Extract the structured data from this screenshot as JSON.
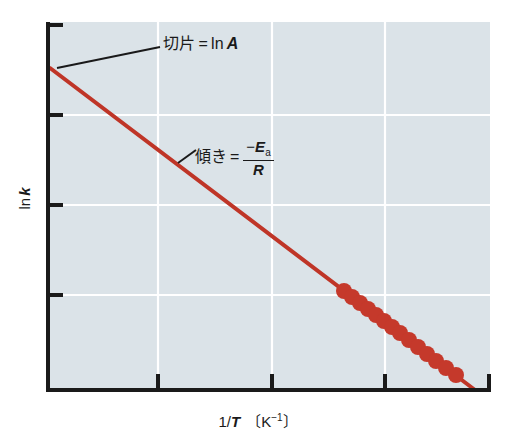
{
  "figure": {
    "background_color": "#ffffff",
    "plot_background_color": "#dbe3e8",
    "gridline_color": "#ffffff",
    "axis_color": "#1a1a1a",
    "series_color": "#bf3527"
  },
  "annotations": {
    "intercept": {
      "jp": "切片",
      "equals": "=",
      "ln": "ln",
      "variable": "A",
      "full_text": "切片 = ln A"
    },
    "slope": {
      "jp": "傾き",
      "equals": "=",
      "numerator_minus": "−",
      "numerator_symbol": "E",
      "numerator_subscript": "a",
      "denominator": "R",
      "full_text": "傾き = −Ea/R"
    }
  },
  "axes": {
    "x_title_main": "1/",
    "x_title_italic": "T",
    "x_title_unit_open": "〔K",
    "x_title_unit_exp": "−1",
    "x_title_unit_close": "〕",
    "x_title_full": "1/T 〔K⁻¹〕",
    "y_title_main": "ln",
    "y_title_italic": "k",
    "y_title_full": "ln k"
  },
  "chart_data": {
    "type": "line",
    "title": "",
    "subtitle": "",
    "xlabel": "1/T 〔K⁻¹〕",
    "ylabel": "ln k",
    "grid": true,
    "legend": "none",
    "x_tick_labels": [
      "",
      "",
      "",
      "",
      ""
    ],
    "y_tick_labels": [
      "",
      "",
      "",
      ""
    ],
    "x_tick_positions_px": [
      48,
      158,
      272,
      385,
      490
    ],
    "y_tick_positions_px": [
      25,
      115,
      205,
      295
    ],
    "x_gridline_positions_px": [
      158,
      272,
      385
    ],
    "y_gridline_positions_px": [
      115,
      205,
      295
    ],
    "xlim": [
      0,
      1
    ],
    "ylim": [
      0,
      1
    ],
    "series": [
      {
        "name": "fitted-line",
        "type": "line",
        "x": [
          0.004,
          0.965
        ],
        "y": [
          0.875,
          0.003
        ],
        "x_px": [
          50,
          475
        ],
        "y_px": [
          68,
          390
        ]
      },
      {
        "name": "data-points",
        "type": "scatter",
        "marker": "circle",
        "marker_radius_px": 8,
        "count": 14,
        "x_px": [
          344,
          352,
          360,
          368,
          376,
          384,
          392,
          400,
          409,
          418,
          427,
          436,
          446,
          456
        ],
        "y_px": [
          291,
          297,
          303,
          309,
          315,
          321,
          327,
          333,
          340,
          347,
          354,
          361,
          368,
          375
        ],
        "x": [
          0.67,
          0.688,
          0.706,
          0.724,
          0.743,
          0.761,
          0.779,
          0.797,
          0.818,
          0.838,
          0.859,
          0.879,
          0.902,
          0.924
        ],
        "y": [
          0.271,
          0.254,
          0.238,
          0.222,
          0.205,
          0.189,
          0.173,
          0.156,
          0.137,
          0.118,
          0.099,
          0.08,
          0.061,
          0.042
        ]
      }
    ]
  }
}
